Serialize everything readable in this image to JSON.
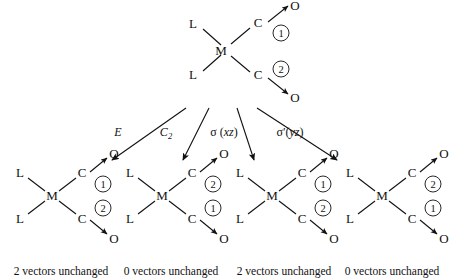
{
  "figure": {
    "background": "#ffffff",
    "ink": "#111111",
    "type": "symmetry-operation-diagram"
  },
  "parent": {
    "label": "parent-complex",
    "center_atom": "M",
    "ligands": [
      "L",
      "L"
    ],
    "carbonyls": [
      {
        "carbon": "C",
        "oxygen": "O",
        "vector_label": "1",
        "vector_direction": "up-right"
      },
      {
        "carbon": "C",
        "oxygen": "O",
        "vector_label": "2",
        "vector_direction": "down-right"
      }
    ]
  },
  "operations": [
    {
      "name": "E",
      "symbol": "E",
      "subscript": "",
      "plane": "",
      "italic": true
    },
    {
      "name": "C2",
      "symbol": "C",
      "subscript": "2",
      "plane": "",
      "italic": true
    },
    {
      "name": "sigma-xz",
      "symbol": "σ",
      "subscript": "",
      "plane": "xz",
      "prime": false
    },
    {
      "name": "sigma-yz",
      "symbol": "σ",
      "subscript": "",
      "plane": "yz",
      "prime": true
    }
  ],
  "results": [
    {
      "operation": "E",
      "center_atom": "M",
      "ligands": [
        "L",
        "L"
      ],
      "top_vector_label": "1",
      "bottom_vector_label": "2",
      "caption": "2 vectors unchanged",
      "unchanged_count": 2
    },
    {
      "operation": "C2",
      "center_atom": "M",
      "ligands": [
        "L",
        "L"
      ],
      "top_vector_label": "2",
      "bottom_vector_label": "1",
      "caption": "0 vectors unchanged",
      "unchanged_count": 0
    },
    {
      "operation": "sigma-xz",
      "center_atom": "M",
      "ligands": [
        "L",
        "L"
      ],
      "top_vector_label": "1",
      "bottom_vector_label": "2",
      "caption": "2 vectors unchanged",
      "unchanged_count": 2
    },
    {
      "operation": "sigma-yz",
      "center_atom": "M",
      "ligands": [
        "L",
        "L"
      ],
      "top_vector_label": "2",
      "bottom_vector_label": "1",
      "caption": "0 vectors unchanged",
      "unchanged_count": 0
    }
  ],
  "atom_labels": {
    "metal": "M",
    "ligand": "L",
    "carbon": "C",
    "oxygen": "O"
  }
}
